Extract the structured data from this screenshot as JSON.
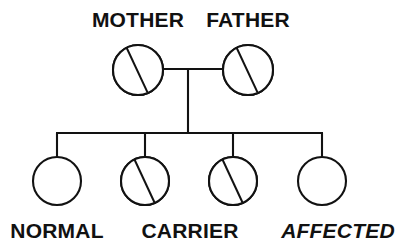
{
  "diagram": {
    "type": "pedigree-chart",
    "colors": {
      "stroke": "#121212",
      "background": "#ffffff",
      "stipple_dot": "#222222",
      "fill_normal": "#ffffff"
    },
    "parents": {
      "mother": {
        "label": "MOTHER",
        "status": "carrier",
        "symbol": "half-stippled-circle",
        "cx": 138,
        "cy": 70,
        "r": 25
      },
      "father": {
        "label": "FATHER",
        "status": "carrier",
        "symbol": "half-stippled-circle",
        "cx": 248,
        "cy": 70,
        "r": 25
      }
    },
    "children": [
      {
        "label": "NORMAL",
        "status": "normal",
        "symbol": "empty-circle",
        "cx": 57,
        "cy": 181,
        "r": 24
      },
      {
        "label": "",
        "status": "carrier",
        "symbol": "half-stippled-circle",
        "cx": 145,
        "cy": 181,
        "r": 24
      },
      {
        "label": "CARRIER",
        "status": "carrier",
        "symbol": "half-stippled-circle",
        "cx": 233,
        "cy": 181,
        "r": 24
      },
      {
        "label": "AFFECTED",
        "status": "affected",
        "symbol": "full-stippled-circle",
        "cx": 322,
        "cy": 181,
        "r": 24
      }
    ],
    "legend": {
      "normal_label": "NORMAL",
      "carrier_label": "CARRIER",
      "affected_label": "AFFECTED"
    },
    "connectors": {
      "marriage_line_y": 69,
      "descent_line_x": 188,
      "sibship_line_y": 133,
      "sibship_line_x_start": 57,
      "sibship_line_x_end": 322
    }
  }
}
